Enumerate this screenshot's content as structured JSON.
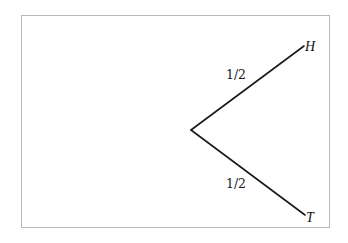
{
  "diagram": {
    "type": "probability-tree",
    "colors": {
      "line": "#1a1a1a",
      "frame_border": "#b8b8b8",
      "background": "#ffffff"
    },
    "root": {
      "x": 191,
      "y": 130
    },
    "branches": [
      {
        "id": "heads",
        "probability_label": "1/2",
        "outcome_label": "H",
        "end": {
          "x": 304,
          "y": 46
        },
        "prob_label_pos": {
          "x": 236,
          "y": 79
        },
        "outcome_label_pos": {
          "x": 305,
          "y": 51
        }
      },
      {
        "id": "tails",
        "probability_label": "1/2",
        "outcome_label": "T",
        "end": {
          "x": 305,
          "y": 215
        },
        "prob_label_pos": {
          "x": 236,
          "y": 188
        },
        "outcome_label_pos": {
          "x": 306,
          "y": 222
        }
      }
    ]
  }
}
